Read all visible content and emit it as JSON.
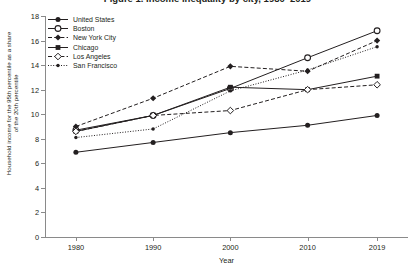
{
  "title": "Figure 1. Income inequality by city, 1980–2019",
  "axes": {
    "ylabel": "Household income for the 95th percentile as a share of the 20th percentile",
    "xlabel": "Year",
    "yticks": [
      0,
      2,
      4,
      6,
      8,
      10,
      12,
      14,
      16,
      18
    ],
    "xticks": [
      "1980",
      "1990",
      "2000",
      "2010",
      "2019"
    ]
  },
  "chart_data": {
    "type": "line",
    "title": "Figure 1. Income inequality by city, 1980–2019",
    "xlabel": "Year",
    "ylabel": "Household income for the 95th percentile as a share of the 20th percentile",
    "x": [
      1980,
      1990,
      2000,
      2010,
      2019
    ],
    "xlim": [
      1976,
      2023
    ],
    "ylim": [
      0,
      18
    ],
    "ytick_step": 2,
    "grid": false,
    "legend_position": "top-left",
    "series": [
      {
        "name": "United States",
        "values": [
          6.9,
          7.7,
          8.5,
          9.1,
          9.9
        ],
        "line_style": "solid",
        "marker": "circle-filled",
        "color": "#231f20"
      },
      {
        "name": "Boston",
        "values": [
          8.7,
          9.9,
          12.1,
          14.6,
          16.8
        ],
        "line_style": "solid",
        "marker": "circle-open",
        "color": "#231f20"
      },
      {
        "name": "New York City",
        "values": [
          9.0,
          11.3,
          13.9,
          13.5,
          16.0
        ],
        "line_style": "dashed",
        "marker": "diamond-filled",
        "color": "#231f20"
      },
      {
        "name": "Chicago",
        "values": [
          8.6,
          9.9,
          12.2,
          12.0,
          13.1
        ],
        "line_style": "solid",
        "marker": "square-filled",
        "color": "#231f20"
      },
      {
        "name": "Los Angeles",
        "values": [
          8.6,
          9.9,
          10.3,
          12.0,
          12.4
        ],
        "line_style": "dashed",
        "marker": "diamond-open",
        "color": "#231f20"
      },
      {
        "name": "San Francisco",
        "values": [
          8.1,
          8.8,
          11.9,
          13.6,
          15.5
        ],
        "line_style": "dotted",
        "marker": "circle-small",
        "color": "#231f20"
      }
    ]
  }
}
